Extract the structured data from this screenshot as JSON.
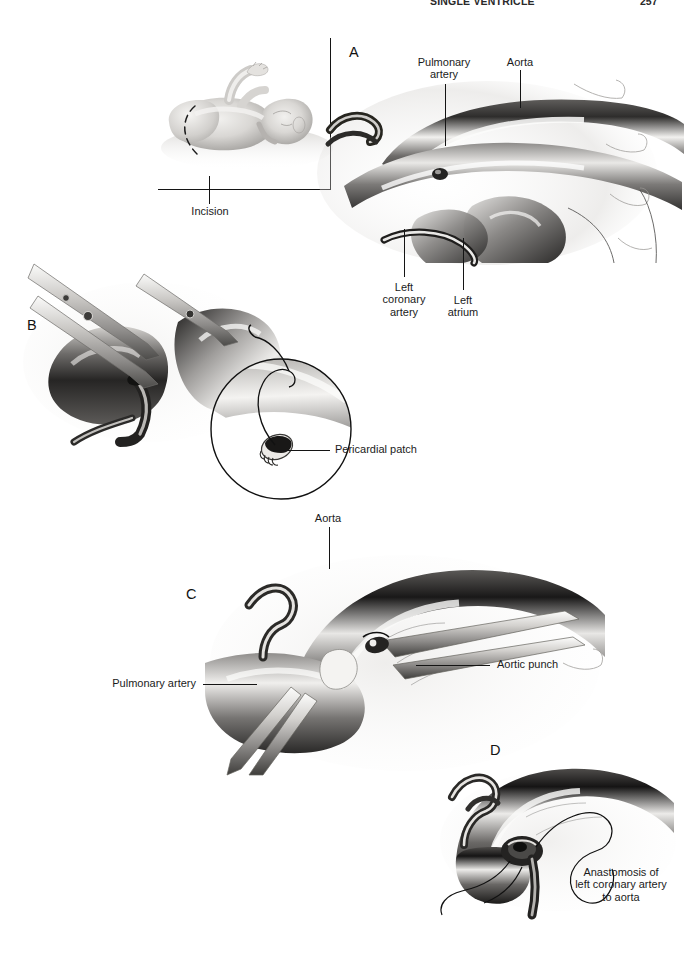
{
  "document": {
    "type": "surgical-atlas-figure",
    "background_color": "#ffffff",
    "ink_color": "#1b1b1b",
    "header": {
      "running_title": "SINGLE VENTRICLE",
      "page_number": "257"
    }
  },
  "panels": [
    {
      "id": "inset-infant",
      "letter": "",
      "caption": "",
      "description": "Infant lying supine with dashed curved line marking the thoracotomy incision, enclosed by an L-shaped inset rule"
    },
    {
      "id": "A",
      "letter": "A",
      "description": "Operative exposure showing pulmonary artery, aorta, left coronary artery and left atrium"
    },
    {
      "id": "B",
      "letter": "B",
      "description": "Scissors dividing the vessel; circular magnified inset shows the pericardial patch with suture"
    },
    {
      "id": "C",
      "letter": "C",
      "description": "Aortic punch creating an opening in the aorta above the pulmonary artery"
    },
    {
      "id": "D",
      "letter": "D",
      "description": "Completed anastomosis of the left coronary artery to the aorta with running suture"
    }
  ],
  "labels": {
    "incision": "Incision",
    "pulmonary_artery_a": "Pulmonary\nartery",
    "aorta_a": "Aorta",
    "left_coronary_artery": "Left\ncoronary\nartery",
    "left_atrium": "Left\natrium",
    "pericardial_patch": "Pericardial patch",
    "aorta_c": "Aorta",
    "pulmonary_artery_c": "Pulmonary artery",
    "aortic_punch": "Aortic punch",
    "anastomosis": "Anastomosis of\nleft coronary artery\nto aorta"
  },
  "panel_letters": {
    "a": "A",
    "b": "B",
    "c": "C",
    "d": "D"
  }
}
